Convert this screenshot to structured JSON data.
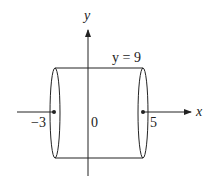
{
  "diagram": {
    "type": "cylinder-region",
    "labels": {
      "y_axis": "y",
      "x_axis": "x",
      "top_line": "y = 9",
      "left_point": "−3",
      "origin": "0",
      "right_point": "5"
    },
    "colors": {
      "stroke": "#222222",
      "background": "#ffffff"
    }
  }
}
